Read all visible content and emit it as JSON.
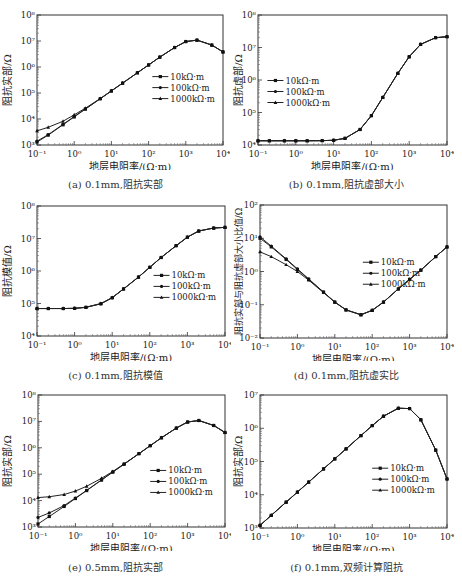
{
  "x_values": [
    0.1,
    0.2,
    0.5,
    1,
    2,
    5,
    10,
    20,
    50,
    100,
    200,
    500,
    1000,
    2000,
    5000,
    10000
  ],
  "legend": [
    "10kΩ·m",
    "100kΩ·m",
    "1000kΩ·m"
  ],
  "xlabel": "地层电阻率/(Ω·m)",
  "chart_data": [
    {
      "id": "a",
      "type": "line",
      "caption": "(a) 0.1mm,阻抗实部",
      "title": "",
      "xlabel": "地层电阻率/(Ω·m)",
      "ylabel": "阻抗实部/Ω",
      "xscale": "log",
      "yscale": "log",
      "xlim": [
        0.1,
        10000
      ],
      "ylim": [
        1000,
        100000000
      ],
      "xticks": [
        "10⁻¹",
        "10⁰",
        "10¹",
        "10²",
        "10³",
        "10⁴"
      ],
      "yticks": [
        "10³",
        "10⁴",
        "10⁵",
        "10⁶",
        "10⁷",
        "10⁸"
      ],
      "legend_position": [
        0.62,
        0.32
      ],
      "x": [
        0.1,
        0.2,
        0.5,
        1,
        2,
        5,
        10,
        20,
        50,
        100,
        200,
        500,
        1000,
        2000,
        5000,
        10000
      ],
      "series": [
        {
          "name": "10kΩ·m",
          "values": [
            1300,
            2400,
            6000,
            12000,
            24000,
            60000,
            120000,
            240000,
            600000,
            1200000,
            2400000,
            5600000,
            9500000,
            10800000,
            7000000,
            3800000
          ]
        },
        {
          "name": "100kΩ·m",
          "values": [
            1400,
            2500,
            6200,
            12500,
            24500,
            60000,
            120000,
            240000,
            600000,
            1200000,
            2400000,
            5600000,
            9500000,
            10800000,
            7000000,
            3800000
          ]
        },
        {
          "name": "1000kΩ·m",
          "values": [
            3500,
            4800,
            8200,
            14500,
            26000,
            61000,
            121000,
            240000,
            600000,
            1200000,
            2400000,
            5600000,
            9500000,
            10800000,
            7000000,
            3800000
          ]
        }
      ]
    },
    {
      "id": "b",
      "type": "line",
      "caption": "(b) 0.1mm,阻抗虚部大小",
      "title": "",
      "xlabel": "地层电阻率/(Ω·m)",
      "ylabel": "阻抗虚部/Ω",
      "xscale": "log",
      "yscale": "log",
      "xlim": [
        0.1,
        10000
      ],
      "ylim": [
        10000,
        100000000
      ],
      "xticks": [
        "10⁻¹",
        "10⁰",
        "10¹",
        "10²",
        "10³",
        "10⁴"
      ],
      "yticks": [
        "10⁴",
        "10⁵",
        "10⁶",
        "10⁷",
        "10⁸"
      ],
      "legend_position": [
        0.05,
        0.35
      ],
      "x": [
        0.1,
        0.2,
        0.5,
        1,
        2,
        5,
        10,
        20,
        50,
        100,
        200,
        500,
        1000,
        2000,
        5000,
        10000
      ],
      "series": [
        {
          "name": "10kΩ·m",
          "values": [
            13500,
            13500,
            13500,
            13500,
            13500,
            13600,
            14000,
            16000,
            30000,
            80000,
            290000,
            1600000,
            5200000,
            12500000,
            20000000,
            21500000
          ]
        },
        {
          "name": "100kΩ·m",
          "values": [
            13500,
            13500,
            13500,
            13500,
            13500,
            13600,
            14000,
            16000,
            30000,
            80000,
            290000,
            1600000,
            5200000,
            12500000,
            20000000,
            21500000
          ]
        },
        {
          "name": "1000kΩ·m",
          "values": [
            13500,
            13500,
            13500,
            13500,
            13500,
            13600,
            14000,
            16000,
            30000,
            80000,
            290000,
            1600000,
            5200000,
            12500000,
            20000000,
            21500000
          ]
        }
      ]
    },
    {
      "id": "c",
      "type": "line",
      "caption": "(c) 0.1mm,阻抗模值",
      "title": "",
      "xlabel": "地层电阻率/(Ω·m)",
      "ylabel": "阻抗模值/Ω",
      "xscale": "log",
      "yscale": "log",
      "xlim": [
        0.1,
        10000
      ],
      "ylim": [
        10000,
        100000000
      ],
      "xticks": [
        "10⁻¹",
        "10⁰",
        "10¹",
        "10²",
        "10³",
        "10⁴"
      ],
      "yticks": [
        "10⁴",
        "10⁵",
        "10⁶",
        "10⁷",
        "10⁸"
      ],
      "legend_position": [
        0.62,
        0.38
      ],
      "x": [
        0.1,
        0.2,
        0.5,
        1,
        2,
        5,
        10,
        20,
        50,
        100,
        200,
        500,
        1000,
        2000,
        5000,
        10000
      ],
      "series": [
        {
          "name": "10kΩ·m",
          "values": [
            70000,
            70000,
            70000,
            71000,
            76000,
            98000,
            150000,
            280000,
            650000,
            1300000,
            2600000,
            6000000,
            11000000,
            17000000,
            21000000,
            22000000
          ]
        },
        {
          "name": "100kΩ·m",
          "values": [
            70000,
            70000,
            70000,
            71000,
            76000,
            98000,
            150000,
            280000,
            650000,
            1300000,
            2600000,
            6000000,
            11000000,
            17000000,
            21000000,
            22000000
          ]
        },
        {
          "name": "1000kΩ·m",
          "values": [
            70000,
            70000,
            70000,
            71000,
            77000,
            100000,
            152000,
            280000,
            650000,
            1300000,
            2600000,
            6000000,
            11000000,
            17000000,
            21000000,
            22000000
          ]
        }
      ]
    },
    {
      "id": "d",
      "type": "line",
      "caption": "(d) 0.1mm,阻抗虚实比",
      "title": "",
      "xlabel": "地层电阻率/(Ω·m)",
      "ylabel": "阻抗实部与阻抗虚部大小比值/Ω",
      "xscale": "log",
      "yscale": "log",
      "xlim": [
        0.1,
        10000
      ],
      "ylim": [
        0.01,
        100
      ],
      "xticks": [
        "10⁻¹",
        "10⁰",
        "10¹",
        "10²",
        "10³",
        "10⁴"
      ],
      "yticks": [
        "10⁻²",
        "10⁻¹",
        "10⁰",
        "10¹",
        "10²"
      ],
      "legend_position": [
        0.55,
        0.28
      ],
      "x": [
        0.1,
        0.2,
        0.5,
        1,
        2,
        5,
        10,
        20,
        50,
        100,
        200,
        500,
        1000,
        2000,
        5000,
        10000
      ],
      "series": [
        {
          "name": "10kΩ·m",
          "values": [
            10,
            5.5,
            2.3,
            1.15,
            0.58,
            0.24,
            0.12,
            0.07,
            0.05,
            0.068,
            0.12,
            0.3,
            0.58,
            1.1,
            2.8,
            5.5
          ]
        },
        {
          "name": "100kΩ·m",
          "values": [
            11,
            5.8,
            2.4,
            1.2,
            0.6,
            0.24,
            0.12,
            0.07,
            0.05,
            0.068,
            0.12,
            0.3,
            0.58,
            1.1,
            2.8,
            5.5
          ]
        },
        {
          "name": "1000kΩ·m",
          "values": [
            3.9,
            2.8,
            1.6,
            1.0,
            0.55,
            0.23,
            0.12,
            0.07,
            0.05,
            0.068,
            0.12,
            0.3,
            0.58,
            1.1,
            2.8,
            5.5
          ]
        }
      ]
    },
    {
      "id": "e",
      "type": "line",
      "caption": "(e) 0.5mm,阻抗实部",
      "title": "",
      "xlabel": "地层电阻率/(Ω·m)",
      "ylabel": "阻抗实部/Ω",
      "xscale": "log",
      "yscale": "log",
      "xlim": [
        0.1,
        10000
      ],
      "ylim": [
        1000,
        100000000
      ],
      "xticks": [
        "10⁻¹",
        "10⁰",
        "10¹",
        "10²",
        "10³",
        "10⁴"
      ],
      "yticks": [
        "10³",
        "10⁴",
        "10⁵",
        "10⁶",
        "10⁷",
        "10⁸"
      ],
      "legend_position": [
        0.6,
        0.42
      ],
      "x": [
        0.1,
        0.2,
        0.5,
        1,
        2,
        5,
        10,
        20,
        50,
        100,
        200,
        500,
        1000,
        2000,
        5000,
        10000
      ],
      "series": [
        {
          "name": "10kΩ·m",
          "values": [
            1300,
            2500,
            6000,
            12000,
            24000,
            60000,
            120000,
            240000,
            600000,
            1200000,
            2400000,
            5600000,
            9500000,
            10800000,
            7000000,
            3800000
          ]
        },
        {
          "name": "100kΩ·m",
          "values": [
            2300,
            3400,
            6500,
            12500,
            24500,
            61000,
            121000,
            240000,
            600000,
            1200000,
            2400000,
            5600000,
            9500000,
            10800000,
            7000000,
            3800000
          ]
        },
        {
          "name": "1000kΩ·m",
          "values": [
            13000,
            14000,
            17000,
            23000,
            35000,
            70000,
            127000,
            245000,
            600000,
            1200000,
            2400000,
            5600000,
            9500000,
            10800000,
            7000000,
            3800000
          ]
        }
      ]
    },
    {
      "id": "f",
      "type": "line",
      "caption": "(f) 0.1mm,双频计算阻抗",
      "title": "",
      "xlabel": "地层电阻率/(Ω·m)",
      "ylabel": "阻抗实部/Ω",
      "xscale": "log",
      "yscale": "log",
      "xlim": [
        0.1,
        10000
      ],
      "ylim": [
        1000,
        10000000
      ],
      "xticks": [
        "10⁻¹",
        "10⁰",
        "10¹",
        "10²",
        "10³",
        "10⁴"
      ],
      "yticks": [
        "10³",
        "10⁴",
        "10⁵",
        "10⁶",
        "10⁷"
      ],
      "legend_position": [
        0.6,
        0.4
      ],
      "x": [
        0.1,
        0.2,
        0.5,
        1,
        2,
        5,
        10,
        20,
        50,
        100,
        200,
        500,
        1000,
        2000,
        5000,
        10000
      ],
      "series": [
        {
          "name": "10kΩ·m",
          "values": [
            1200,
            2400,
            6000,
            12000,
            24000,
            60000,
            120000,
            240000,
            600000,
            1200000,
            2300000,
            4000000,
            3900000,
            1800000,
            220000,
            30000
          ]
        },
        {
          "name": "100kΩ·m",
          "values": [
            1200,
            2400,
            6000,
            12000,
            24000,
            60000,
            120000,
            240000,
            600000,
            1200000,
            2300000,
            4000000,
            3900000,
            1800000,
            220000,
            30000
          ]
        },
        {
          "name": "1000kΩ·m",
          "values": [
            1200,
            2400,
            6000,
            12000,
            24000,
            60000,
            120000,
            240000,
            600000,
            1200000,
            2300000,
            4000000,
            3900000,
            1800000,
            220000,
            30000
          ]
        }
      ]
    }
  ]
}
